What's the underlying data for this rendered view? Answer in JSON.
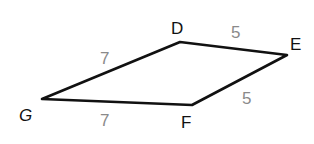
{
  "figure": {
    "type": "kite",
    "stroke_color": "#111111",
    "side_label_color": "#8a8a8a",
    "vertices": {
      "D": {
        "label": "D",
        "x": 180,
        "y": 42
      },
      "E": {
        "label": "E",
        "x": 287,
        "y": 55
      },
      "F": {
        "label": "F",
        "x": 192,
        "y": 105
      },
      "G": {
        "label": "G",
        "x": 42,
        "y": 99
      }
    },
    "sides": {
      "DE": {
        "label": "5"
      },
      "EF": {
        "label": "5"
      },
      "FG": {
        "label": "7"
      },
      "GD": {
        "label": "7"
      }
    }
  }
}
